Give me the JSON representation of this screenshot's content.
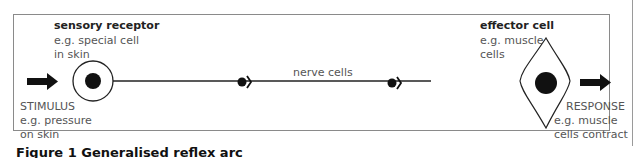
{
  "diagram": {
    "sensory_receptor": {
      "title": "sensory receptor",
      "example_line1": "e.g. special cell",
      "example_line2": "in skin"
    },
    "stimulus": {
      "title": "STIMULUS",
      "example_line1": "e.g. pressure",
      "example_line2": "on skin"
    },
    "nerve_cells": {
      "label": "nerve cells"
    },
    "effector_cell": {
      "title": "effector cell",
      "example_line1": "e.g. muscle",
      "example_line2": "cells"
    },
    "response": {
      "title": "RESPONSE",
      "example_line1": "e.g. muscle",
      "example_line2": "cells contract"
    },
    "icons": [
      "stimulus-arrow",
      "receptor-cell",
      "synapse",
      "synapse",
      "effector-cell",
      "response-arrow"
    ],
    "colors": {
      "line": "#222222",
      "fill": "#111111",
      "border": "#8a8a8a"
    }
  },
  "caption": "Figure 1  Generalised reflex arc"
}
